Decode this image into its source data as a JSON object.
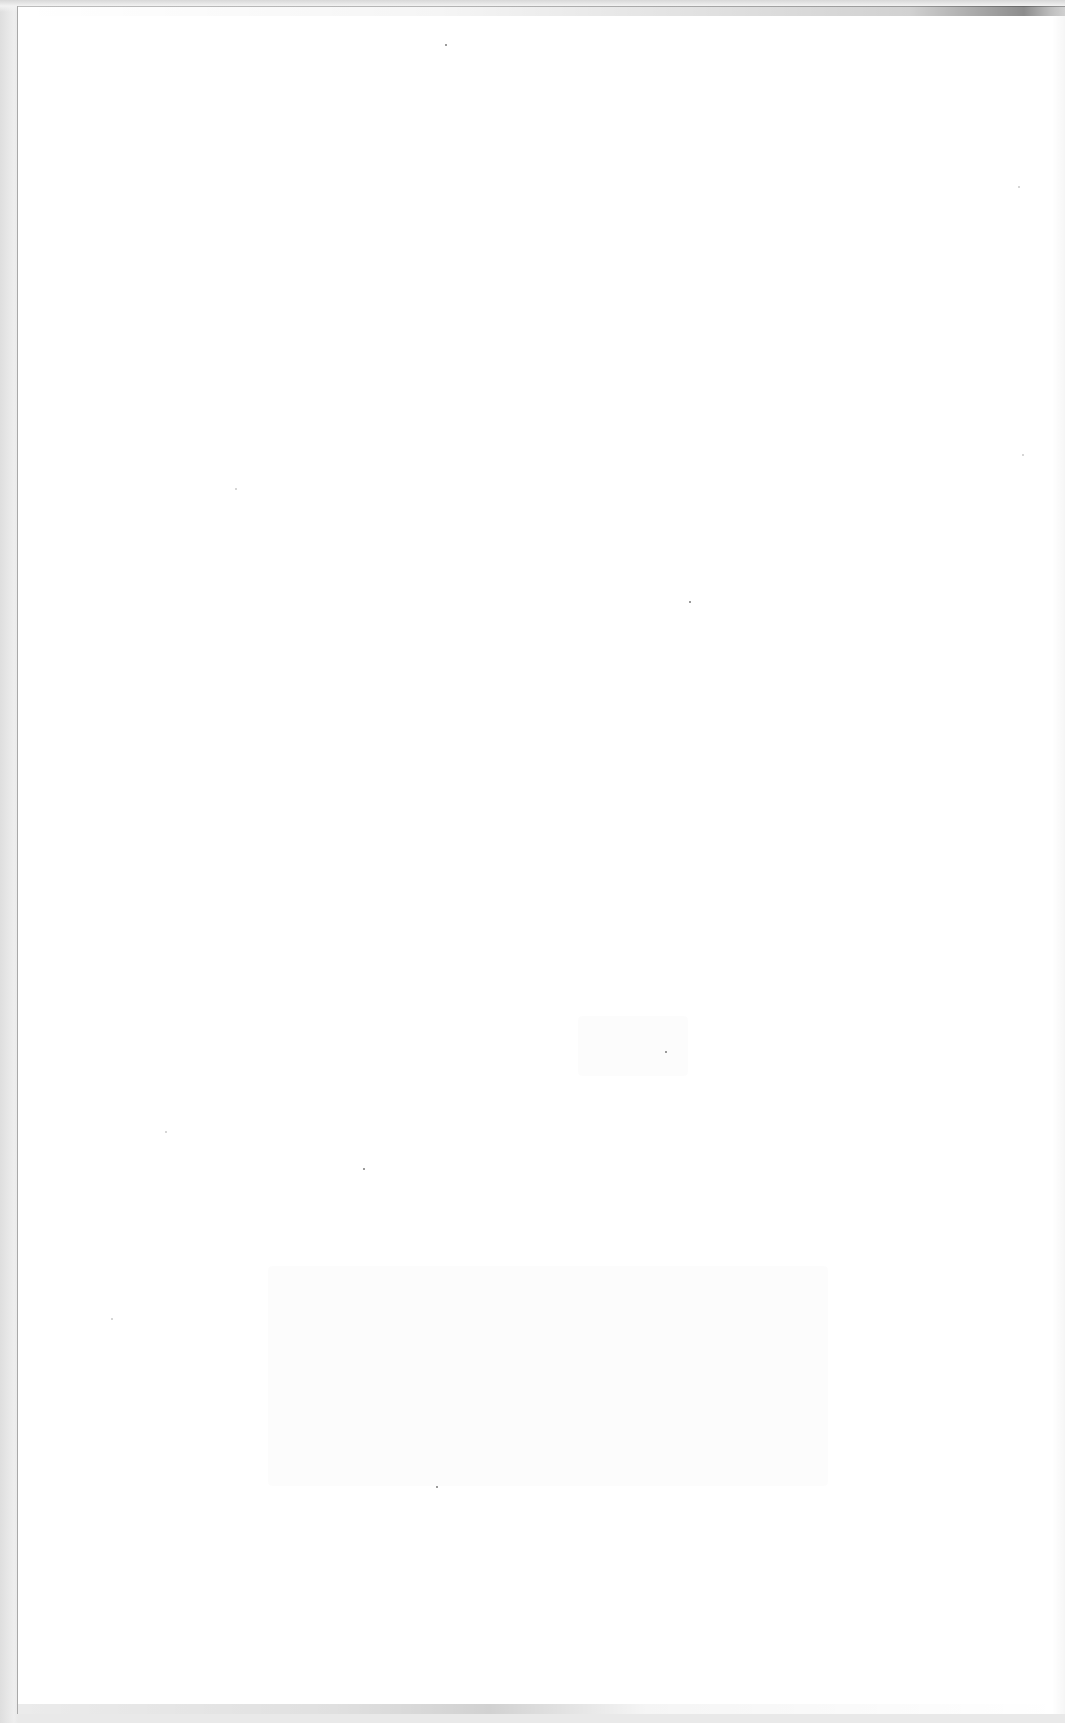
{
  "document": {
    "type": "scanned-page",
    "content": "blank",
    "text": ""
  },
  "colors": {
    "paper": "#ffffff",
    "scanner_border": "#e9e9e9",
    "edge_line": "#a9a9a9"
  }
}
